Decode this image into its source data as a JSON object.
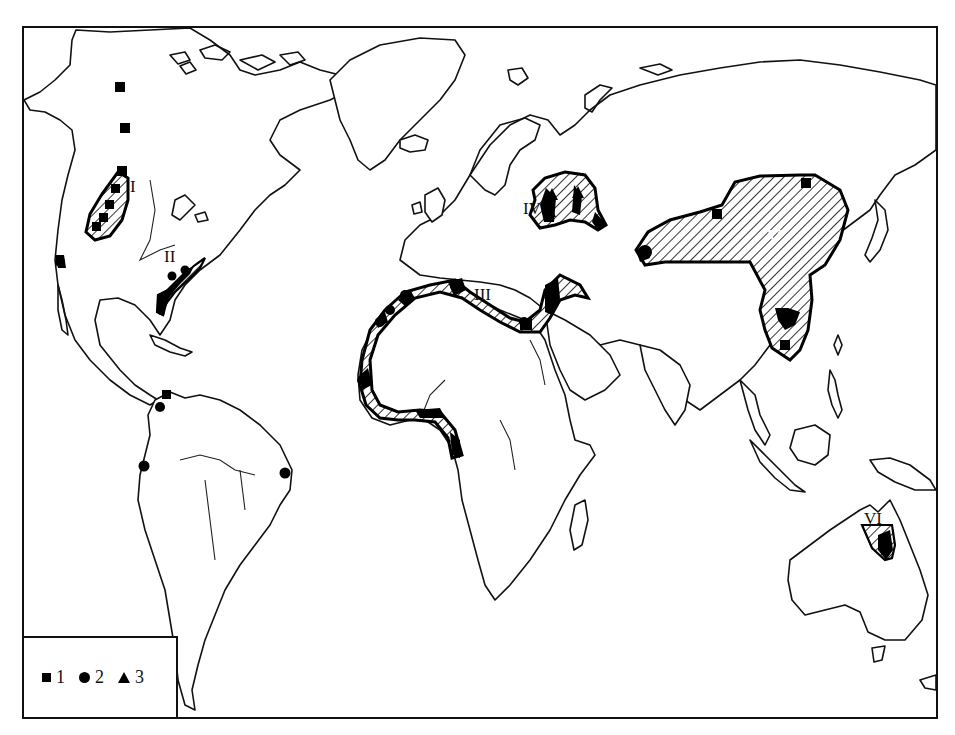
{
  "map": {
    "type": "world distribution map",
    "background": "#ffffff",
    "ink": "#000000",
    "regions": [
      {
        "id": "I",
        "label": "I",
        "description": "Western North America (Rocky Mountains)"
      },
      {
        "id": "II",
        "label": "II",
        "description": "Eastern North America (Atlantic coast)"
      },
      {
        "id": "III",
        "label": "III",
        "description": "Mediterranean / North & West Africa coast"
      },
      {
        "id": "IV",
        "label": "IV",
        "description": "Central Europe"
      },
      {
        "id": "V",
        "label": "V",
        "description": "China / East Asia"
      },
      {
        "id": "VI",
        "label": "VI",
        "description": "Northeastern Australia"
      }
    ]
  },
  "legend": {
    "items": [
      {
        "symbol": "square",
        "label": "1"
      },
      {
        "symbol": "circle",
        "label": "2"
      },
      {
        "symbol": "triangle",
        "label": "3"
      }
    ]
  }
}
